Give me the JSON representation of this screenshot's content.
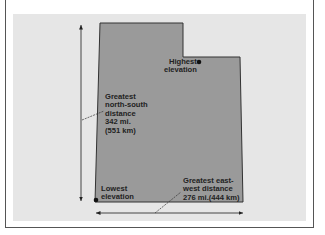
{
  "diagram": {
    "shape_fill": "#9a9a9a",
    "panel_color": "#e6e6e6",
    "labels": {
      "highest": [
        "Highest",
        "elevation"
      ],
      "north_south": [
        "Greatest",
        "north-south",
        "distance",
        "342 mi.",
        "(551 km)"
      ],
      "lowest": [
        "Lowest",
        "elevation"
      ],
      "east_west": [
        "Greatest east-",
        "west distance",
        "276 mi.(444 km)"
      ]
    }
  }
}
